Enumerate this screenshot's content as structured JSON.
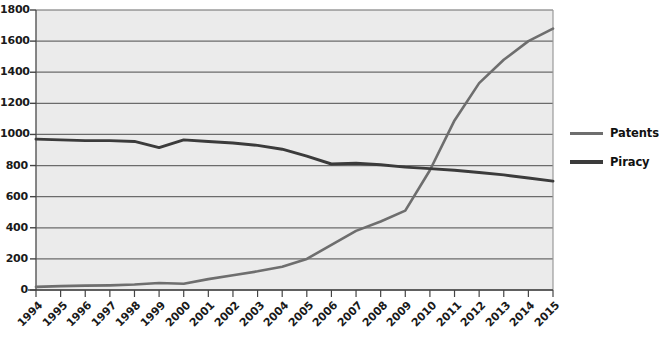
{
  "chart_data": {
    "type": "line",
    "title": "",
    "xlabel": "",
    "ylabel": "",
    "x": [
      1994,
      1995,
      1996,
      1997,
      1998,
      1999,
      2000,
      2001,
      2002,
      2003,
      2004,
      2005,
      2006,
      2007,
      2008,
      2009,
      2010,
      2011,
      2012,
      2013,
      2014,
      2015
    ],
    "categories": [
      "1994",
      "1995",
      "1996",
      "1997",
      "1998",
      "1999",
      "2000",
      "2001",
      "2002",
      "2003",
      "2004",
      "2005",
      "2006",
      "2007",
      "2008",
      "2009",
      "2010",
      "2011",
      "2012",
      "2013",
      "2014",
      "2015"
    ],
    "series": [
      {
        "name": "Patents",
        "color": "#6e6e6e",
        "values": [
          20,
          25,
          28,
          30,
          35,
          45,
          40,
          70,
          95,
          120,
          150,
          200,
          290,
          380,
          440,
          510,
          770,
          1090,
          1330,
          1480,
          1600,
          1680
        ]
      },
      {
        "name": "Piracy",
        "color": "#3b3b3b",
        "values": [
          970,
          965,
          960,
          960,
          955,
          915,
          965,
          955,
          945,
          930,
          905,
          860,
          810,
          815,
          805,
          790,
          780,
          770,
          755,
          740,
          720,
          700
        ]
      }
    ],
    "ylim": [
      0,
      1800
    ],
    "ytick_step": 200,
    "yticks": [
      "0",
      "200",
      "400",
      "600",
      "800",
      "1000",
      "1200",
      "1400",
      "1600",
      "1800"
    ],
    "grid": true,
    "legend_position": "right",
    "legend": [
      "Patents",
      "Piracy"
    ],
    "plot_background": "#ebebeb",
    "gridline_color": "#6b6b6b",
    "axis_color": "#555555"
  },
  "legend": {
    "items": [
      {
        "label": "Patents"
      },
      {
        "label": "Piracy"
      }
    ]
  }
}
